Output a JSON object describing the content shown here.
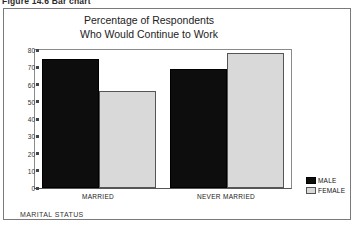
{
  "figure": {
    "caption": "Figure 14.6  Bar chart"
  },
  "chart_data": {
    "type": "bar",
    "title": "Percentage of Respondents",
    "subtitle": "Who Would Continue to Work",
    "title_lines": [
      "Percentage of Respondents",
      "Who Would Continue to Work"
    ],
    "categories": [
      "MARRIED",
      "NEVER MARRIED"
    ],
    "series": [
      {
        "name": "MALE",
        "color": "#0d0d0d",
        "values": [
          75,
          69
        ]
      },
      {
        "name": "FEMALE",
        "color": "#d9d9d9",
        "values": [
          56,
          78
        ]
      }
    ],
    "xlabel": "MARITAL STATUS",
    "ylabel": "",
    "ylim": [
      0,
      80
    ],
    "yticks": [
      80,
      70,
      60,
      50,
      40,
      30,
      20,
      10,
      0
    ],
    "ytick_labels": [
      "80",
      "70",
      "60",
      "50",
      "40",
      "30",
      "20",
      "10",
      "0"
    ],
    "grid": false,
    "legend_position": "right-bottom-outside"
  }
}
